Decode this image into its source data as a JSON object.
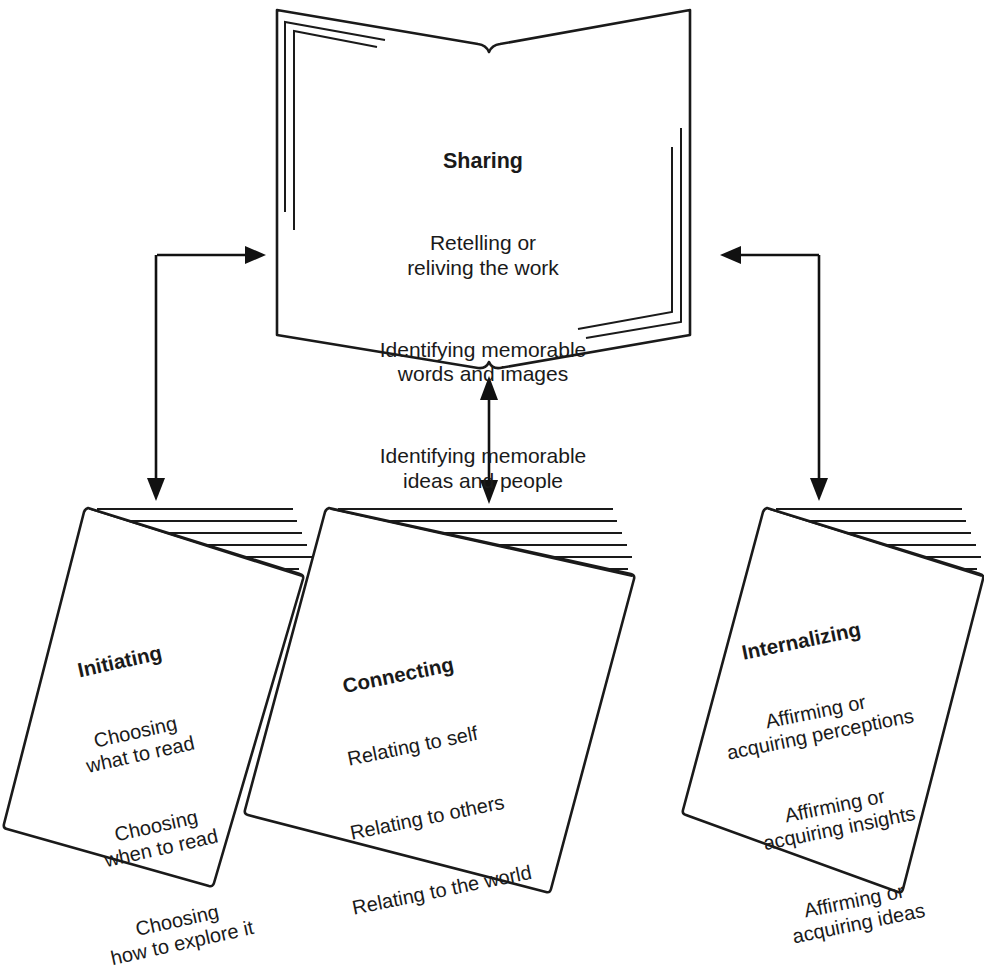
{
  "diagram": {
    "background_color": "#ffffff",
    "line_color": "#1a1a1a"
  },
  "nodes": {
    "sharing": {
      "shape": "open-book",
      "title": "Sharing",
      "lines": [
        "Retelling or\nreliving the work",
        "Identifying memorable\nwords and images",
        "Identifying memorable\nideas and people"
      ]
    },
    "initiating": {
      "shape": "booklet",
      "title": "Initiating",
      "lines": [
        "Choosing\nwhat to read",
        "Choosing\nwhen to read",
        "Choosing\nhow to explore it"
      ]
    },
    "connecting": {
      "shape": "booklet",
      "title": "Connecting",
      "lines": [
        "Relating to self",
        "Relating to others",
        "Relating to the world"
      ]
    },
    "internalizing": {
      "shape": "booklet",
      "title": "Internalizing",
      "lines": [
        "Affirming or\nacquiring perceptions",
        "Affirming or\nacquiring insights",
        "Affirming or\nacquiring ideas"
      ]
    }
  },
  "connectors": [
    {
      "name": "sharing-to-initiating",
      "from": "sharing",
      "to": "initiating",
      "style": "elbow",
      "direction": "both"
    },
    {
      "name": "sharing-to-connecting",
      "from": "sharing",
      "to": "connecting",
      "style": "straight",
      "direction": "both"
    },
    {
      "name": "sharing-to-internalizing",
      "from": "sharing",
      "to": "internalizing",
      "style": "elbow",
      "direction": "both"
    }
  ]
}
